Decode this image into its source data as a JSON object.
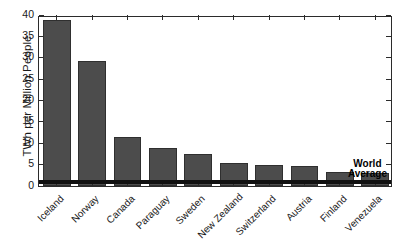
{
  "chart_data": {
    "type": "bar",
    "title": "",
    "xlabel": "",
    "ylabel": "TWh per Million People",
    "ylim": [
      0,
      40
    ],
    "yticks": [
      0,
      5,
      10,
      15,
      20,
      25,
      30,
      35,
      40
    ],
    "ytick_labels": [
      "0",
      "5",
      "10",
      "15",
      "20",
      "25",
      "30",
      "35",
      "40"
    ],
    "grid": false,
    "legend": null,
    "categories": [
      "Iceland",
      "Norway",
      "Canada",
      "Paraguay",
      "Sweden",
      "New Zealand",
      "Switzerland",
      "Austria",
      "Finland",
      "Venezuela"
    ],
    "values": [
      38.8,
      29.3,
      11.5,
      9.0,
      7.6,
      5.3,
      4.8,
      4.7,
      3.2,
      3.1
    ],
    "bar_color": "#4c4c4c",
    "bar_edge_color": "#2f2f2f",
    "annotations": [
      {
        "name": "world-average",
        "label_line1": "World",
        "label_line2": "Average",
        "value": 0.55,
        "color": "#111111"
      }
    ]
  },
  "axes": {
    "frame_color": "#2b2b2b",
    "background": "#ffffff"
  }
}
